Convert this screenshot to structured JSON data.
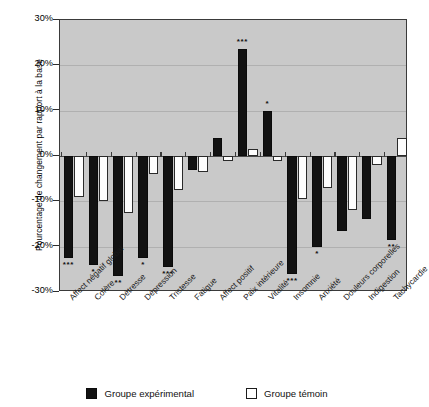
{
  "chart_data": {
    "type": "bar",
    "title": "",
    "xlabel": "",
    "ylabel": "Pourcentage de changement par rapport à la base",
    "ylim": [
      -30,
      30
    ],
    "ytick_labels": [
      "30%",
      "20%",
      "10%",
      "0%",
      "-10%",
      "-20%",
      "-30%"
    ],
    "ytick_values": [
      30,
      20,
      10,
      0,
      -10,
      -20,
      -30
    ],
    "grid": true,
    "legend_position": "bottom",
    "categories": [
      "Affect négatif global",
      "Colère",
      "Détresse",
      "Dépression",
      "Tristesse",
      "Fatigue",
      "Affect positif",
      "Paix intérieure",
      "Vitalité",
      "Insomnie",
      "Anxiété",
      "Douleurs corporelles",
      "Indigestion",
      "Tachycardie"
    ],
    "series": [
      {
        "name": "Groupe expérimental",
        "color": "#121212",
        "values": [
          -22.5,
          -24.0,
          -26.5,
          -22.5,
          -24.5,
          -3.0,
          4.0,
          23.5,
          10.0,
          -26.0,
          -20.0,
          -16.5,
          -14.0,
          -18.5
        ],
        "significance": [
          "***",
          "*",
          "**",
          "*",
          "***",
          "",
          "",
          "***",
          "*",
          "***",
          "*",
          "",
          "",
          "**"
        ]
      },
      {
        "name": "Groupe témoin",
        "color": "#ffffff",
        "values": [
          -9.0,
          -10.0,
          -12.5,
          -4.0,
          -7.5,
          -3.5,
          -1.0,
          1.5,
          -1.0,
          -9.5,
          -7.0,
          -12.0,
          -2.0,
          4.0
        ],
        "significance": [
          "",
          "",
          "",
          "",
          "",
          "",
          "",
          "",
          "",
          "",
          "",
          "",
          "",
          ""
        ]
      }
    ]
  },
  "legend": {
    "items": [
      {
        "label": "Groupe expérimental",
        "swatch": "filled-black-square"
      },
      {
        "label": "Groupe témoin",
        "swatch": "open-white-square"
      }
    ]
  }
}
